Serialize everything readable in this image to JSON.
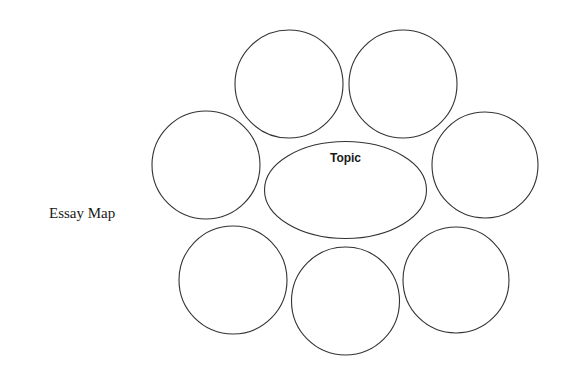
{
  "title": "Essay Map",
  "diagram": {
    "type": "bubble-map",
    "stroke_color": "#333333",
    "center": {
      "label": "Topic",
      "shape": "ellipse",
      "cx": 345.5,
      "cy": 190,
      "rx": 81,
      "ry": 48.5
    },
    "satellites": [
      {
        "id": "top-left",
        "label": "",
        "cx": 289,
        "cy": 84,
        "r": 54
      },
      {
        "id": "top-right",
        "label": "",
        "cx": 403,
        "cy": 84,
        "r": 54
      },
      {
        "id": "middle-left",
        "label": "",
        "cx": 206,
        "cy": 165,
        "r": 54
      },
      {
        "id": "middle-right",
        "label": "",
        "cx": 485,
        "cy": 165,
        "r": 53
      },
      {
        "id": "bottom-left",
        "label": "",
        "cx": 233,
        "cy": 280,
        "r": 54
      },
      {
        "id": "bottom-middle",
        "label": "",
        "cx": 345.5,
        "cy": 301,
        "r": 54
      },
      {
        "id": "bottom-right",
        "label": "",
        "cx": 456,
        "cy": 280,
        "r": 53
      }
    ]
  }
}
